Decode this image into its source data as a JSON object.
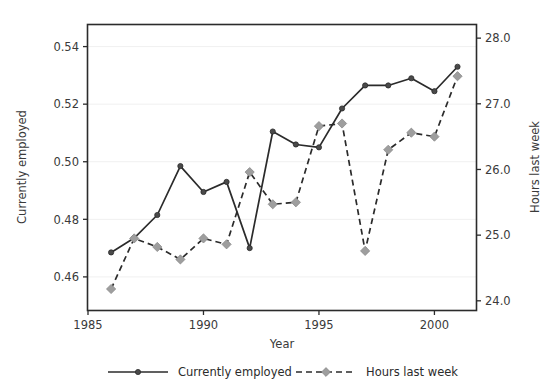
{
  "chart_data": {
    "type": "line",
    "title": "",
    "subtitle": "",
    "xlabel": "Year",
    "ylabel": "Currently employed",
    "y2label": "Hours last week",
    "grid": true,
    "legend_position": "bottom",
    "xlim": [
      1985.0,
      2001.8
    ],
    "ylim": [
      0.4485,
      0.5475
    ],
    "y2lim": [
      23.86,
      28.2
    ],
    "xticks": [
      1985,
      1990,
      1995,
      2000
    ],
    "xtick_labels": [
      "1985",
      "1990",
      "1995",
      "2000"
    ],
    "yticks": [
      0.46,
      0.48,
      0.5,
      0.52,
      0.54
    ],
    "ytick_labels": [
      "0.46",
      "0.48",
      "0.50",
      "0.52",
      "0.54"
    ],
    "y2ticks": [
      24.0,
      25.0,
      26.0,
      27.0,
      28.0
    ],
    "y2tick_labels": [
      "24.0",
      "25.0",
      "26.0",
      "27.0",
      "28.0"
    ],
    "x": [
      1986,
      1987,
      1988,
      1989,
      1990,
      1991,
      1992,
      1993,
      1994,
      1995,
      1996,
      1997,
      1998,
      1999,
      2000,
      2001
    ],
    "series": [
      {
        "name": "Currently employed",
        "axis": "left",
        "linestyle": "solid",
        "marker": "circle",
        "color": "#2b2b2b",
        "marker_color": "#4a4a4a",
        "values": [
          0.4685,
          0.4735,
          0.4815,
          0.4985,
          0.4895,
          0.493,
          0.47,
          0.5105,
          0.506,
          0.505,
          0.5185,
          0.5265,
          0.5265,
          0.529,
          0.5245,
          0.533
        ]
      },
      {
        "name": "Hours last week",
        "axis": "right",
        "linestyle": "dashed",
        "marker": "diamond",
        "color": "#2b2b2b",
        "marker_color": "#9e9e9e",
        "values": [
          24.18,
          24.95,
          24.82,
          24.63,
          24.95,
          24.86,
          25.96,
          25.47,
          25.5,
          26.66,
          26.7,
          24.76,
          26.3,
          26.56,
          26.5,
          27.42
        ]
      }
    ]
  },
  "legend": {
    "entries": [
      {
        "label": "Currently employed",
        "style": "solid-line-circle-marker"
      },
      {
        "label": "Hours last week",
        "style": "dashed-line-diamond-marker"
      }
    ]
  },
  "axes": {
    "left_title": "Currently employed",
    "right_title": "Hours last week",
    "bottom_title": "Year"
  }
}
